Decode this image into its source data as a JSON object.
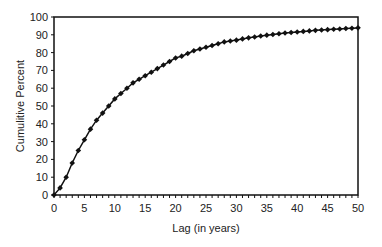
{
  "chart_data": {
    "type": "line",
    "title": "",
    "xlabel": "Lag (in years)",
    "ylabel": "Cumulitive Percent",
    "xlim": [
      0,
      50
    ],
    "ylim": [
      0,
      100
    ],
    "x_ticks": [
      0,
      5,
      10,
      15,
      20,
      25,
      30,
      35,
      40,
      45,
      50
    ],
    "y_ticks": [
      0,
      10,
      20,
      30,
      40,
      50,
      60,
      70,
      80,
      90,
      100
    ],
    "grid": false,
    "legend": null,
    "marker": "diamond",
    "series": [
      {
        "name": "Cumulative Percent",
        "x": [
          0,
          1,
          2,
          3,
          4,
          5,
          6,
          7,
          8,
          9,
          10,
          11,
          12,
          13,
          14,
          15,
          16,
          17,
          18,
          19,
          20,
          21,
          22,
          23,
          24,
          25,
          26,
          27,
          28,
          29,
          30,
          31,
          32,
          33,
          34,
          35,
          36,
          37,
          38,
          39,
          40,
          41,
          42,
          43,
          44,
          45,
          46,
          47,
          48,
          49,
          50
        ],
        "values": [
          0,
          4,
          10,
          18,
          25,
          31,
          37,
          42,
          46,
          50,
          54,
          57,
          60,
          63,
          65,
          67,
          69,
          71,
          73,
          75,
          77,
          78,
          79.5,
          81,
          82,
          83,
          84,
          85,
          86,
          86.5,
          87,
          87.7,
          88.3,
          88.8,
          89.3,
          89.8,
          90.2,
          90.6,
          91,
          91.3,
          91.6,
          91.9,
          92.2,
          92.5,
          92.7,
          92.9,
          93.1,
          93.3,
          93.5,
          93.7,
          93.9
        ]
      }
    ]
  }
}
